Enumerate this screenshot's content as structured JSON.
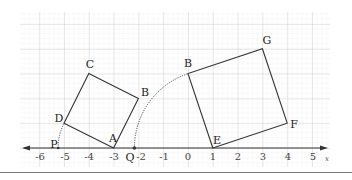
{
  "diagram": {
    "type": "coordinate-geometry",
    "axis": {
      "name": "x",
      "ticks": [
        "-6",
        "-5",
        "-4",
        "-3",
        "-2",
        "-1",
        "0",
        "1",
        "2",
        "3",
        "4",
        "5"
      ]
    },
    "squares": [
      {
        "name": "square-ABCD",
        "vertices": [
          "A",
          "B",
          "C",
          "D"
        ]
      },
      {
        "name": "square-EFGB",
        "vertices": [
          "E",
          "F",
          "G",
          "B"
        ]
      }
    ],
    "points": {
      "A": {
        "label": "A",
        "x": -3,
        "y": 0
      },
      "B": {
        "label": "B",
        "x": -2,
        "y": 2
      },
      "C": {
        "label": "C",
        "x": -4,
        "y": 3
      },
      "D": {
        "label": "D",
        "x": -5,
        "y": 1
      },
      "E": {
        "label": "E",
        "x": 1,
        "y": 0
      },
      "F": {
        "label": "F",
        "x": 4,
        "y": 1
      },
      "G": {
        "label": "G",
        "x": 3,
        "y": 4
      },
      "B2": {
        "label": "B",
        "x": 0,
        "y": 3
      },
      "P": {
        "label": "P",
        "x": -5.24,
        "y": 0
      },
      "Q": {
        "label": "Q",
        "x": -2.16,
        "y": 0
      }
    },
    "arcs": [
      {
        "name": "arc-P",
        "center": "A",
        "through": "D",
        "ends_at": "P"
      },
      {
        "name": "arc-Q",
        "center": "E",
        "through": "B",
        "ends_at": "Q"
      }
    ],
    "colors": {
      "grid_major": "#c8c8c8",
      "grid_minor": "#ececec",
      "line": "#333333"
    }
  }
}
